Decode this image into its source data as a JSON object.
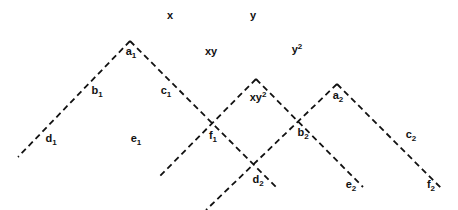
{
  "diagram": {
    "header_labels": [
      {
        "id": "x",
        "base": "x",
        "script": "",
        "x": 170,
        "y": 15
      },
      {
        "id": "y",
        "base": "y",
        "script": "",
        "x": 253,
        "y": 15
      },
      {
        "id": "xy",
        "base": "xy",
        "script": "",
        "x": 211,
        "y": 51
      },
      {
        "id": "y2",
        "base": "y",
        "sup": "2",
        "x": 297,
        "y": 49
      }
    ],
    "node_labels": [
      {
        "id": "a1",
        "base": "a",
        "sub": "1",
        "x": 131,
        "y": 53
      },
      {
        "id": "b1",
        "base": "b",
        "sub": "1",
        "x": 97,
        "y": 92
      },
      {
        "id": "c1",
        "base": "c",
        "sub": "1",
        "x": 166,
        "y": 92
      },
      {
        "id": "d1",
        "base": "d",
        "sub": "1",
        "x": 51,
        "y": 140
      },
      {
        "id": "e1",
        "base": "e",
        "sub": "1",
        "x": 136,
        "y": 140
      },
      {
        "id": "f1",
        "base": "f",
        "sub": "1",
        "x": 213,
        "y": 137
      },
      {
        "id": "xy2",
        "base": "xy",
        "sup": "2",
        "x": 258,
        "y": 97
      },
      {
        "id": "a2",
        "base": "a",
        "sub": "2",
        "x": 338,
        "y": 97
      },
      {
        "id": "b2",
        "base": "b",
        "sub": "2",
        "x": 303,
        "y": 134
      },
      {
        "id": "c2",
        "base": "c",
        "sub": "2",
        "x": 411,
        "y": 136
      },
      {
        "id": "d2",
        "base": "d",
        "sub": "2",
        "x": 258,
        "y": 181
      },
      {
        "id": "e2",
        "base": "e",
        "sub": "2",
        "x": 351,
        "y": 186
      },
      {
        "id": "f2",
        "base": "f",
        "sub": "2",
        "x": 431,
        "y": 186
      }
    ],
    "lines": [
      {
        "id": "tri1-left",
        "x1": 130,
        "y1": 41,
        "x2": 18,
        "y2": 157
      },
      {
        "id": "tri1-right",
        "x1": 130,
        "y1": 41,
        "x2": 277,
        "y2": 188
      },
      {
        "id": "tri2-left",
        "x1": 256,
        "y1": 79,
        "x2": 160,
        "y2": 176
      },
      {
        "id": "tri2-right",
        "x1": 256,
        "y1": 79,
        "x2": 363,
        "y2": 187
      },
      {
        "id": "tri3-left",
        "x1": 337,
        "y1": 84,
        "x2": 206,
        "y2": 210
      },
      {
        "id": "tri3-right",
        "x1": 337,
        "y1": 84,
        "x2": 442,
        "y2": 189
      }
    ],
    "line_color": "#111111"
  }
}
